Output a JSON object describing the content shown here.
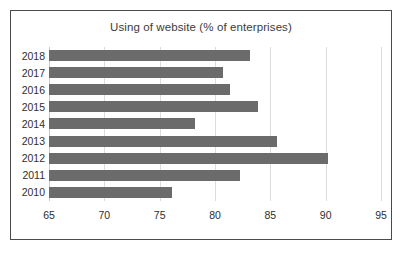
{
  "chart_data": {
    "type": "bar",
    "orientation": "horizontal",
    "title": "Using of website (% of enterprises)",
    "xlabel": "",
    "ylabel": "",
    "categories": [
      "2018",
      "2017",
      "2016",
      "2015",
      "2014",
      "2013",
      "2012",
      "2011",
      "2010"
    ],
    "values": [
      83.2,
      80.7,
      81.4,
      83.9,
      78.2,
      85.6,
      90.2,
      82.3,
      76.1
    ],
    "xlim": [
      65,
      95
    ],
    "xticks": [
      65,
      70,
      75,
      80,
      85,
      90,
      95
    ],
    "xtick_labels": [
      "65",
      "70",
      "75",
      "80",
      "85",
      "90",
      "95"
    ],
    "grid": true,
    "grid_axis": "x",
    "legend": false,
    "bar_color": "#6b6b6b",
    "gridline_color": "#dcdcdc",
    "border_color": "#4a4a4a",
    "background": "#ffffff"
  }
}
